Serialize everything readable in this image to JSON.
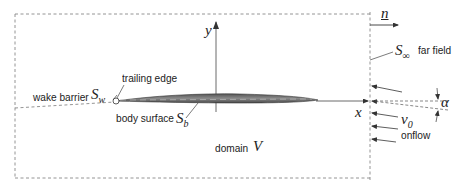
{
  "diagram": {
    "labels": {
      "y_axis": "y",
      "x_axis": "x",
      "normal": "n",
      "far_field_symbol": "S",
      "far_field_sub": "∞",
      "far_field_text": "far field",
      "trailing_edge": "trailing edge",
      "wake_barrier_text": "wake barrier",
      "wake_symbol": "S",
      "wake_sub": "w",
      "body_surface_text": "body surface",
      "body_symbol": "S",
      "body_sub": "b",
      "domain_text": "domain",
      "domain_symbol": "V",
      "onflow_symbol": "v",
      "onflow_sub": "0",
      "onflow_text": "onflow",
      "angle_symbol": "α"
    },
    "colors": {
      "line": "#333333",
      "dashed": "#777777",
      "airfoil_fill": "#6a6a6a",
      "background": "#ffffff"
    }
  }
}
